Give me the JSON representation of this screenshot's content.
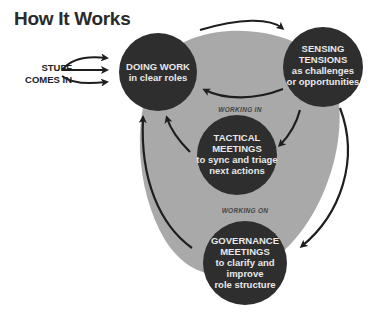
{
  "title": "How It Works",
  "input": {
    "label_line1": "STUFF",
    "label_line2": "COMES IN",
    "arrow_count": 3
  },
  "nodes": [
    {
      "id": "doing-work",
      "heading": "DOING WORK",
      "subtitle": "in clear roles"
    },
    {
      "id": "sensing-tensions",
      "heading_line1": "SENSING",
      "heading_line2": "TENSIONS",
      "subtitle_line1": "as challenges",
      "subtitle_line2": "or opportunities"
    },
    {
      "id": "tactical-meetings",
      "heading_line1": "TACTICAL",
      "heading_line2": "MEETINGS",
      "subtitle_line1": "to sync and triage",
      "subtitle_line2": "next actions"
    },
    {
      "id": "governance-meetings",
      "heading_line1": "GOVERNANCE",
      "heading_line2": "MEETINGS",
      "subtitle_line1": "to clarify and",
      "subtitle_line2": "improve",
      "subtitle_line3": "role structure"
    }
  ],
  "loop_labels": {
    "inner": "WORKING IN",
    "outer": "WORKING ON"
  },
  "colors": {
    "node_fill": "#2e2e2e",
    "loop_fill": "#a9a9a9",
    "arrow": "#1e1e1e",
    "node_text": "#e8e8e8"
  }
}
